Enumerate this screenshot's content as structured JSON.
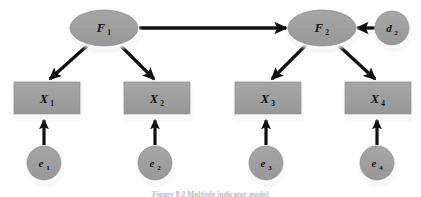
{
  "figure": {
    "type": "path-diagram",
    "caption": "Figure 8.2 Multiple indicator model",
    "background_color": "#ffffff",
    "node_fill": "#9d9d9d",
    "node_stroke": "#8a8a8a",
    "arrow_color": "#111111",
    "label_color": "#141414",
    "shadow_color": "#ffffff"
  },
  "nodes": {
    "factors": [
      {
        "id": "F1",
        "label": "F",
        "sub": "1",
        "shape": "ellipse",
        "cx": 104,
        "cy": 28,
        "rx": 34,
        "ry": 18
      },
      {
        "id": "F2",
        "label": "F",
        "sub": "2",
        "shape": "ellipse",
        "cx": 322,
        "cy": 28,
        "rx": 34,
        "ry": 18
      }
    ],
    "disturbances": [
      {
        "id": "d2",
        "label": "d",
        "sub": "2",
        "shape": "circle",
        "cx": 392,
        "cy": 28,
        "r": 17
      }
    ],
    "indicators": [
      {
        "id": "X1",
        "label": "X",
        "sub": "1",
        "shape": "rect",
        "x": 14,
        "y": 82,
        "w": 66,
        "h": 32
      },
      {
        "id": "X2",
        "label": "X",
        "sub": "2",
        "shape": "rect",
        "x": 124,
        "y": 82,
        "w": 66,
        "h": 32
      },
      {
        "id": "X3",
        "label": "X",
        "sub": "3",
        "shape": "rect",
        "x": 235,
        "y": 82,
        "w": 66,
        "h": 32
      },
      {
        "id": "X4",
        "label": "X",
        "sub": "4",
        "shape": "rect",
        "x": 345,
        "y": 82,
        "w": 66,
        "h": 32
      }
    ],
    "errors": [
      {
        "id": "e1",
        "label": "e",
        "sub": "1",
        "shape": "circle",
        "cx": 44,
        "cy": 163,
        "r": 17
      },
      {
        "id": "e2",
        "label": "e",
        "sub": "2",
        "shape": "circle",
        "cx": 155,
        "cy": 163,
        "r": 17
      },
      {
        "id": "e3",
        "label": "e",
        "sub": "3",
        "shape": "circle",
        "cx": 266,
        "cy": 163,
        "r": 17
      },
      {
        "id": "e4",
        "label": "e",
        "sub": "4",
        "shape": "circle",
        "cx": 377,
        "cy": 163,
        "r": 17
      }
    ]
  },
  "edges": [
    {
      "id": "F1-F2",
      "from": "F1",
      "to": "F2",
      "kind": "structural",
      "direction": "right",
      "x1": 139,
      "y1": 28,
      "x2": 286,
      "y2": 28
    },
    {
      "id": "d2-F2",
      "from": "d2",
      "to": "F2",
      "kind": "disturbance",
      "direction": "left",
      "x1": 374,
      "y1": 28,
      "x2": 358,
      "y2": 28
    },
    {
      "id": "F1-X1",
      "from": "F1",
      "to": "X1",
      "kind": "loading",
      "direction": "down-left",
      "x1": 88,
      "y1": 44,
      "x2": 49,
      "y2": 79
    },
    {
      "id": "F1-X2",
      "from": "F1",
      "to": "X2",
      "kind": "loading",
      "direction": "down-right",
      "x1": 120,
      "y1": 44,
      "x2": 155,
      "y2": 79
    },
    {
      "id": "F2-X3",
      "from": "F2",
      "to": "X3",
      "kind": "loading",
      "direction": "down-left",
      "x1": 306,
      "y1": 44,
      "x2": 271,
      "y2": 79
    },
    {
      "id": "F2-X4",
      "from": "F2",
      "to": "X4",
      "kind": "loading",
      "direction": "down-right",
      "x1": 338,
      "y1": 44,
      "x2": 376,
      "y2": 79
    },
    {
      "id": "e1-X1",
      "from": "e1",
      "to": "X1",
      "kind": "error",
      "direction": "up",
      "x1": 44,
      "y1": 145,
      "x2": 44,
      "y2": 119
    },
    {
      "id": "e2-X2",
      "from": "e2",
      "to": "X2",
      "kind": "error",
      "direction": "up",
      "x1": 155,
      "y1": 145,
      "x2": 155,
      "y2": 119
    },
    {
      "id": "e3-X3",
      "from": "e3",
      "to": "X3",
      "kind": "error",
      "direction": "up",
      "x1": 266,
      "y1": 145,
      "x2": 266,
      "y2": 119
    },
    {
      "id": "e4-X4",
      "from": "e4",
      "to": "X4",
      "kind": "error",
      "direction": "up",
      "x1": 377,
      "y1": 145,
      "x2": 377,
      "y2": 119
    }
  ]
}
